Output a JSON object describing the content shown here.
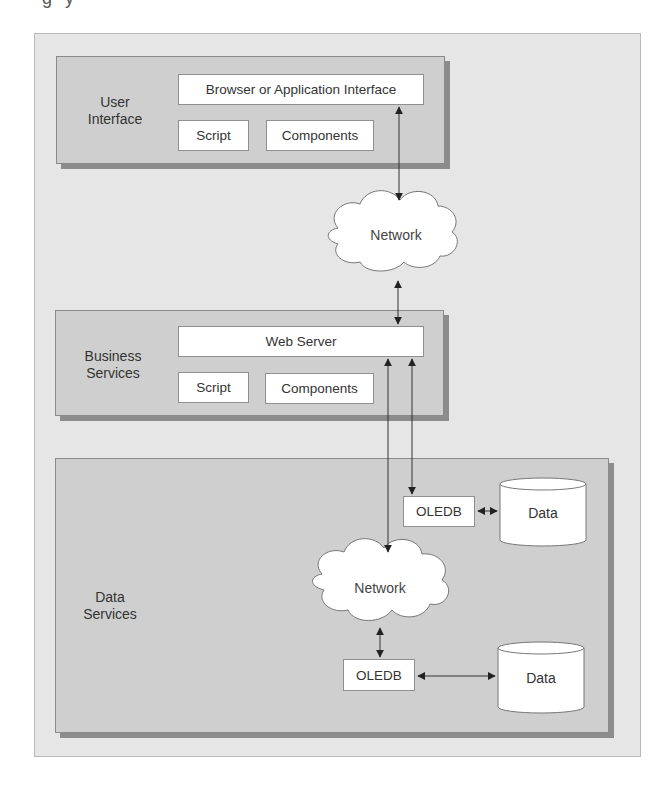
{
  "figure": {
    "cut_off_caption": "g      y"
  },
  "tiers": {
    "user_interface": {
      "label_line1": "User",
      "label_line2": "Interface",
      "browser_box": "Browser or Application Interface",
      "script_box": "Script",
      "components_box": "Components"
    },
    "business_services": {
      "label_line1": "Business",
      "label_line2": "Services",
      "web_server_box": "Web Server",
      "script_box": "Script",
      "components_box": "Components"
    },
    "data_services": {
      "label_line1": "Data",
      "label_line2": "Services",
      "oledb_top": "OLEDB",
      "data_top": "Data",
      "network": "Network",
      "oledb_bottom": "OLEDB",
      "data_bottom": "Data"
    }
  },
  "network_cloud_top": "Network",
  "colors": {
    "frame_bg": "#e6e6e6",
    "tier_bg": "#cfcfcf",
    "tier_shadow": "#8c8c8c",
    "box_bg": "#ffffff",
    "line": "#333333"
  }
}
